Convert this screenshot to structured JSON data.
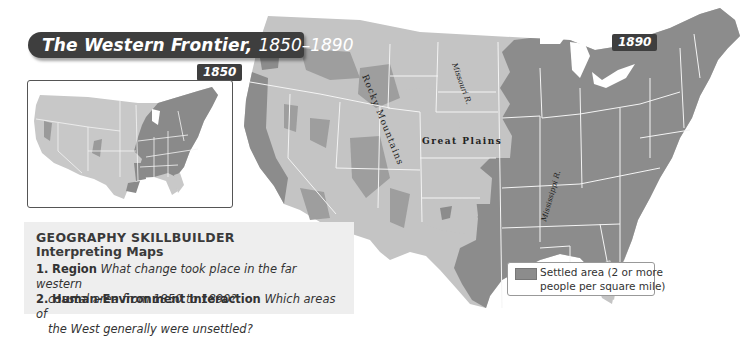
{
  "title": {
    "main": "The Western Frontier,",
    "years": "1850–1890"
  },
  "inset_map": {
    "year_label": "1850"
  },
  "main_map": {
    "year_label": "1890",
    "labels": {
      "rocky_mountains": "Rocky Mountains",
      "great_plains": "Great Plains",
      "missouri_river": "Missouri R.",
      "mississippi_river": "Mississippi R."
    }
  },
  "legend": {
    "line1": "Settled area (2 or more",
    "line2": "people per square mile)",
    "settled_color": "#8c8c8c",
    "unsettled_color": "#c4c4c4"
  },
  "skillbuilder": {
    "heading": "GEOGRAPHY SKILLBUILDER",
    "subheading": "Interpreting Maps",
    "questions": [
      {
        "number": "1.",
        "topic": "Region",
        "text": "What change took place in the far western",
        "continuation": "coastal area from 1850 to 1890?"
      },
      {
        "number": "2.",
        "topic": "Human-Environment Interaction",
        "text": "Which areas of",
        "continuation": "the West generally were unsettled?"
      }
    ]
  }
}
